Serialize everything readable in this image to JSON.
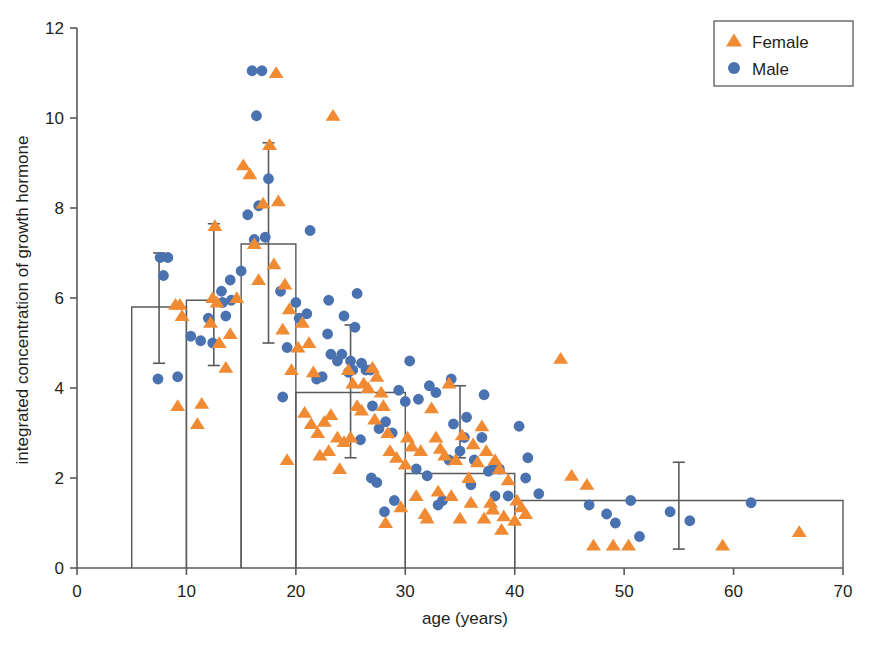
{
  "chart_data": {
    "type": "scatter",
    "title": "",
    "xlabel": "age (years)",
    "ylabel": "integrated concentration of growth hormone",
    "xlim": [
      0,
      70
    ],
    "ylim": [
      0,
      12
    ],
    "xticks": [
      0,
      10,
      20,
      30,
      40,
      50,
      60,
      70
    ],
    "yticks": [
      0,
      2,
      4,
      6,
      8,
      10,
      12
    ],
    "xtick_labels": [
      "0",
      "10",
      "20",
      "30",
      "40",
      "50",
      "60",
      "70"
    ],
    "ytick_labels": [
      "0",
      "2",
      "4",
      "6",
      "8",
      "10",
      "12"
    ],
    "grid": false,
    "legend_position": "top-right",
    "legend": [
      {
        "label": "Female",
        "marker": "triangle",
        "color": "#F08A33"
      },
      {
        "label": "Male",
        "marker": "circle",
        "color": "#4A72B0"
      }
    ],
    "bars": {
      "note": "open outlined bars = group means per age bin",
      "edges": [
        [
          5,
          10
        ],
        [
          10,
          15
        ],
        [
          15,
          20
        ],
        [
          20,
          30
        ],
        [
          30,
          40
        ],
        [
          40,
          70
        ]
      ],
      "values": [
        5.8,
        5.95,
        7.2,
        3.9,
        2.1,
        1.5
      ],
      "edge_color": "#58595b",
      "fill": "none"
    },
    "error_bars": [
      {
        "x": 7.5,
        "mean": 5.8,
        "upper": 7.0,
        "lower": 4.55
      },
      {
        "x": 12.5,
        "mean": 5.95,
        "upper": 7.65,
        "lower": 4.5
      },
      {
        "x": 17.5,
        "mean": 7.2,
        "upper": 9.45,
        "lower": 5.0
      },
      {
        "x": 25.0,
        "mean": 3.9,
        "upper": 5.4,
        "lower": 2.45
      },
      {
        "x": 35.0,
        "mean": 2.1,
        "upper": 4.05,
        "lower": 2.45
      },
      {
        "x": 55.0,
        "mean": 1.5,
        "upper": 2.35,
        "lower": 0.42
      }
    ],
    "series": [
      {
        "name": "Male",
        "marker": "circle",
        "color": "#4A72B0",
        "points": [
          [
            7.6,
            6.9
          ],
          [
            8.3,
            6.9
          ],
          [
            7.9,
            6.5
          ],
          [
            7.4,
            4.2
          ],
          [
            9.2,
            4.25
          ],
          [
            11.3,
            5.05
          ],
          [
            12.4,
            5.0
          ],
          [
            12.0,
            5.55
          ],
          [
            13.3,
            5.9
          ],
          [
            14.1,
            5.95
          ],
          [
            13.2,
            6.15
          ],
          [
            14.0,
            6.4
          ],
          [
            15.6,
            7.85
          ],
          [
            16.0,
            11.05
          ],
          [
            16.9,
            11.05
          ],
          [
            16.4,
            10.05
          ],
          [
            17.5,
            8.65
          ],
          [
            16.6,
            8.05
          ],
          [
            16.2,
            7.3
          ],
          [
            17.2,
            7.35
          ],
          [
            18.6,
            6.15
          ],
          [
            20.0,
            5.9
          ],
          [
            20.3,
            5.55
          ],
          [
            19.2,
            4.9
          ],
          [
            18.8,
            3.8
          ],
          [
            21.3,
            7.5
          ],
          [
            21.0,
            5.65
          ],
          [
            21.9,
            4.2
          ],
          [
            22.4,
            4.25
          ],
          [
            22.9,
            5.2
          ],
          [
            23.2,
            4.75
          ],
          [
            23.8,
            4.6
          ],
          [
            24.4,
            5.6
          ],
          [
            24.2,
            4.75
          ],
          [
            25.0,
            4.6
          ],
          [
            24.8,
            4.35
          ],
          [
            25.6,
            6.1
          ],
          [
            25.4,
            5.35
          ],
          [
            25.2,
            4.4
          ],
          [
            26.0,
            4.55
          ],
          [
            26.4,
            4.4
          ],
          [
            26.8,
            4.4
          ],
          [
            25.9,
            2.85
          ],
          [
            27.0,
            3.6
          ],
          [
            27.6,
            3.1
          ],
          [
            28.2,
            3.25
          ],
          [
            28.8,
            3.0
          ],
          [
            26.9,
            2.0
          ],
          [
            27.4,
            1.9
          ],
          [
            28.1,
            1.25
          ],
          [
            29.0,
            1.5
          ],
          [
            30.4,
            4.6
          ],
          [
            31.2,
            3.75
          ],
          [
            31.0,
            2.2
          ],
          [
            32.2,
            4.05
          ],
          [
            32.8,
            3.9
          ],
          [
            32.0,
            2.05
          ],
          [
            33.4,
            1.5
          ],
          [
            33.0,
            1.4
          ],
          [
            34.2,
            4.2
          ],
          [
            34.4,
            3.2
          ],
          [
            34.0,
            2.4
          ],
          [
            35.0,
            2.6
          ],
          [
            35.6,
            3.35
          ],
          [
            35.4,
            2.9
          ],
          [
            36.3,
            2.4
          ],
          [
            36.0,
            1.85
          ],
          [
            37.2,
            3.85
          ],
          [
            37.0,
            2.9
          ],
          [
            37.6,
            2.15
          ],
          [
            38.0,
            2.2
          ],
          [
            38.6,
            2.2
          ],
          [
            38.2,
            1.6
          ],
          [
            39.4,
            1.6
          ],
          [
            40.4,
            3.15
          ],
          [
            41.2,
            2.45
          ],
          [
            41.0,
            2.0
          ],
          [
            42.2,
            1.65
          ],
          [
            46.8,
            1.4
          ],
          [
            48.4,
            1.2
          ],
          [
            49.2,
            1.0
          ],
          [
            50.6,
            1.5
          ],
          [
            51.4,
            0.7
          ],
          [
            54.2,
            1.25
          ],
          [
            56.0,
            1.05
          ],
          [
            61.6,
            1.45
          ],
          [
            15.0,
            6.6
          ],
          [
            13.6,
            5.6
          ],
          [
            10.4,
            5.15
          ],
          [
            23.0,
            5.95
          ],
          [
            29.4,
            3.95
          ],
          [
            30.0,
            3.7
          ]
        ]
      },
      {
        "name": "Female",
        "marker": "triangle",
        "color": "#F08A33",
        "points": [
          [
            9.0,
            5.85
          ],
          [
            9.4,
            5.85
          ],
          [
            9.6,
            5.6
          ],
          [
            9.2,
            3.6
          ],
          [
            11.0,
            3.2
          ],
          [
            11.4,
            3.65
          ],
          [
            12.6,
            7.6
          ],
          [
            12.4,
            6.0
          ],
          [
            12.8,
            5.9
          ],
          [
            12.2,
            5.45
          ],
          [
            13.0,
            5.0
          ],
          [
            13.6,
            4.45
          ],
          [
            14.0,
            5.2
          ],
          [
            14.6,
            6.0
          ],
          [
            15.2,
            8.95
          ],
          [
            15.8,
            8.75
          ],
          [
            16.2,
            7.2
          ],
          [
            16.6,
            6.4
          ],
          [
            17.0,
            8.1
          ],
          [
            17.6,
            9.4
          ],
          [
            18.2,
            11.0
          ],
          [
            18.4,
            8.15
          ],
          [
            18.0,
            6.75
          ],
          [
            19.0,
            6.3
          ],
          [
            19.4,
            5.75
          ],
          [
            18.8,
            5.3
          ],
          [
            19.6,
            4.4
          ],
          [
            19.2,
            2.4
          ],
          [
            20.2,
            4.9
          ],
          [
            20.6,
            5.45
          ],
          [
            21.2,
            5.0
          ],
          [
            21.6,
            4.35
          ],
          [
            20.8,
            3.45
          ],
          [
            21.4,
            3.2
          ],
          [
            22.0,
            3.0
          ],
          [
            22.6,
            3.25
          ],
          [
            22.2,
            2.5
          ],
          [
            23.0,
            2.6
          ],
          [
            23.4,
            10.05
          ],
          [
            23.2,
            3.4
          ],
          [
            23.8,
            2.9
          ],
          [
            24.4,
            2.8
          ],
          [
            24.0,
            2.2
          ],
          [
            24.8,
            4.4
          ],
          [
            25.2,
            4.1
          ],
          [
            25.6,
            3.6
          ],
          [
            25.0,
            2.9
          ],
          [
            26.2,
            4.1
          ],
          [
            26.6,
            4.0
          ],
          [
            26.0,
            3.5
          ],
          [
            27.0,
            4.45
          ],
          [
            27.4,
            4.25
          ],
          [
            27.8,
            3.9
          ],
          [
            27.2,
            3.3
          ],
          [
            28.0,
            3.6
          ],
          [
            28.4,
            3.0
          ],
          [
            28.6,
            2.6
          ],
          [
            29.2,
            2.45
          ],
          [
            29.6,
            1.35
          ],
          [
            28.2,
            1.0
          ],
          [
            30.2,
            2.9
          ],
          [
            30.6,
            2.7
          ],
          [
            30.0,
            2.3
          ],
          [
            31.4,
            2.6
          ],
          [
            31.0,
            1.6
          ],
          [
            31.8,
            1.2
          ],
          [
            32.4,
            3.55
          ],
          [
            32.8,
            2.9
          ],
          [
            32.0,
            1.1
          ],
          [
            33.2,
            2.65
          ],
          [
            33.6,
            2.5
          ],
          [
            33.0,
            1.7
          ],
          [
            34.0,
            4.1
          ],
          [
            34.6,
            2.4
          ],
          [
            34.2,
            1.6
          ],
          [
            35.2,
            2.95
          ],
          [
            35.8,
            2.0
          ],
          [
            35.0,
            1.1
          ],
          [
            36.2,
            2.75
          ],
          [
            36.6,
            2.35
          ],
          [
            36.0,
            1.45
          ],
          [
            37.0,
            3.15
          ],
          [
            37.4,
            2.6
          ],
          [
            37.8,
            1.45
          ],
          [
            37.2,
            1.1
          ],
          [
            38.2,
            2.4
          ],
          [
            38.6,
            2.2
          ],
          [
            38.0,
            1.3
          ],
          [
            38.8,
            0.85
          ],
          [
            39.4,
            1.95
          ],
          [
            39.0,
            1.15
          ],
          [
            40.2,
            1.5
          ],
          [
            40.6,
            1.35
          ],
          [
            40.0,
            1.05
          ],
          [
            41.0,
            1.2
          ],
          [
            44.2,
            4.65
          ],
          [
            45.2,
            2.05
          ],
          [
            46.6,
            1.85
          ],
          [
            47.2,
            0.5
          ],
          [
            49.0,
            0.5
          ],
          [
            50.4,
            0.5
          ],
          [
            59.0,
            0.5
          ],
          [
            66.0,
            0.8
          ]
        ]
      }
    ]
  }
}
